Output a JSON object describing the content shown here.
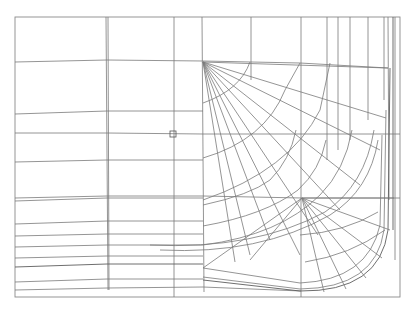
{
  "viewport": {
    "background": "#ffffff",
    "line_color": "#7a7a7a",
    "frame": {
      "x1": 15,
      "y1": 17,
      "x2": 400,
      "y2": 297
    },
    "cursor_marker": {
      "x": 173,
      "y": 134,
      "size": 6
    },
    "hubs": [
      {
        "x": 203,
        "y": 62
      },
      {
        "x": 302,
        "y": 198
      }
    ]
  }
}
